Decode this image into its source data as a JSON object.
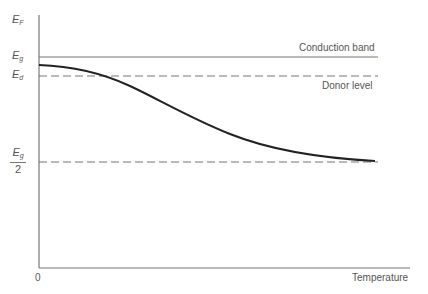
{
  "diagram": {
    "y_axis_label": {
      "main": "E",
      "sub": "F"
    },
    "x_axis_label": "Temperature",
    "origin_label": "0",
    "levels": [
      {
        "id": "conduction",
        "symbol": "E",
        "sub": "g",
        "name": "Conduction band",
        "style": "solid"
      },
      {
        "id": "donor",
        "symbol": "E",
        "sub": "d",
        "name": "Donor level",
        "style": "dashed"
      },
      {
        "id": "midgap",
        "symbol": "E",
        "sub": "g",
        "denominator": "2",
        "name": "",
        "style": "dashed"
      }
    ],
    "curve": {
      "description": "Fermi level vs temperature, starting between Eg and Ed at T=0, decreasing toward Eg/2 at high temperature",
      "color": "#222222"
    },
    "colors": {
      "axis": "#777777",
      "levels": "#777777",
      "curve": "#222222",
      "text": "#555555"
    }
  }
}
